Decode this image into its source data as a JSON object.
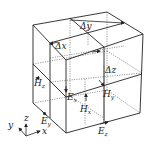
{
  "diagram": {
    "labels": {
      "dy": {
        "main": "Δy",
        "sub": ""
      },
      "dx": {
        "main": "Δx",
        "sub": ""
      },
      "dz": {
        "main": "Δz",
        "sub": ""
      },
      "Hz_left": {
        "main": "H",
        "sub": "z"
      },
      "Ex": {
        "main": "E",
        "sub": "x"
      },
      "Hy": {
        "main": "H",
        "sub": "y"
      },
      "Hx": {
        "main": "H",
        "sub": "x"
      },
      "Ey": {
        "main": "E",
        "sub": "y"
      },
      "Ez": {
        "main": "E",
        "sub": "z"
      }
    },
    "axes": {
      "x": "x",
      "y": "y",
      "z": "z"
    },
    "colors": {
      "line": "#222222",
      "dotted": "#555555",
      "background": "#ffffff"
    }
  }
}
